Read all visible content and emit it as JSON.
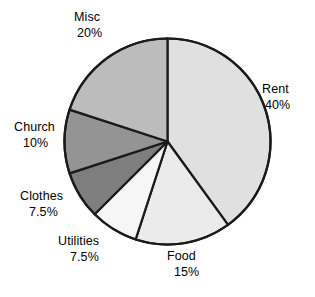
{
  "chart_data": {
    "type": "pie",
    "title": "",
    "subtitle": "",
    "xlabel": "",
    "ylabel": "",
    "legend_position": "none",
    "grid": false,
    "start_angle_deg": 0,
    "direction": "clockwise",
    "center": {
      "x": 167.5,
      "y": 141.5
    },
    "radius": 103,
    "outline_color": "#1a1a1a",
    "categories": [
      "Rent",
      "Food",
      "Utilities",
      "Clothes",
      "Church",
      "Misc"
    ],
    "values": [
      40,
      15,
      7.5,
      7.5,
      10,
      20
    ],
    "slices": [
      {
        "label": "Rent",
        "percent_text": "40%",
        "value": 40,
        "sweep_deg": 144,
        "start_deg": 0,
        "end_deg": 144,
        "fill": "#e0e0e0"
      },
      {
        "label": "Food",
        "percent_text": "15%",
        "value": 15,
        "sweep_deg": 54,
        "start_deg": 144,
        "end_deg": 198,
        "fill": "#ebebeb"
      },
      {
        "label": "Utilities",
        "percent_text": "7.5%",
        "value": 7.5,
        "sweep_deg": 27,
        "start_deg": 198,
        "end_deg": 225,
        "fill": "#f6f6f6"
      },
      {
        "label": "Clothes",
        "percent_text": "7.5%",
        "value": 7.5,
        "sweep_deg": 27,
        "start_deg": 225,
        "end_deg": 252,
        "fill": "#7e7e7e"
      },
      {
        "label": "Church",
        "percent_text": "10%",
        "value": 10,
        "sweep_deg": 36,
        "start_deg": 252,
        "end_deg": 288,
        "fill": "#949494"
      },
      {
        "label": "Misc",
        "percent_text": "20%",
        "value": 20,
        "sweep_deg": 72,
        "start_deg": 288,
        "end_deg": 360,
        "fill": "#bcbcbc"
      }
    ]
  },
  "labels": {
    "rent": {
      "name": "Rent",
      "pct": "40%"
    },
    "food": {
      "name": "Food",
      "pct": "15%"
    },
    "utilities": {
      "name": "Utilities",
      "pct": "7.5%"
    },
    "clothes": {
      "name": "Clothes",
      "pct": "7.5%"
    },
    "church": {
      "name": "Church",
      "pct": "10%"
    },
    "misc": {
      "name": "Misc",
      "pct": "20%"
    }
  }
}
